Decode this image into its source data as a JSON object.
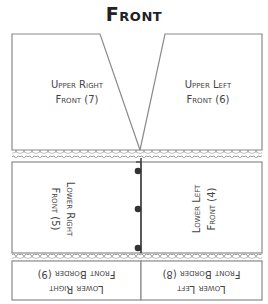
{
  "title": "Front",
  "pieces": {
    "upper_right": {
      "line1": "Upper Right",
      "line2": "Front (7)"
    },
    "upper_left": {
      "line1": "Upper Left",
      "line2": "Front (6)"
    },
    "lower_right": {
      "line1": "Lower Right",
      "line2": "Front (5)"
    },
    "lower_left": {
      "line1": "Lower Left",
      "line2": "Front (4)"
    },
    "lower_right_border": {
      "line1": "Lower Right",
      "line2": "Front Border (9)"
    },
    "lower_left_border": {
      "line1": "Lower Left",
      "line2": "Front Border (8)"
    }
  },
  "colors": {
    "outline": "#8a8a8a",
    "center_line": "#444444",
    "button": "#333333",
    "lace": "#9a9a9a"
  },
  "buttons_count": 3
}
